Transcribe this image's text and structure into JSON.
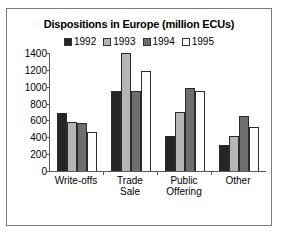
{
  "chart_data": {
    "type": "bar",
    "title": "Dispositions in Europe (million ECUs)",
    "xlabel": "",
    "ylabel": "",
    "ylim": [
      0,
      1400
    ],
    "yticks": [
      0,
      200,
      400,
      600,
      800,
      1000,
      1200,
      1400
    ],
    "grid": false,
    "legend_position": "top-center",
    "categories": [
      "Write-offs",
      "Trade Sale",
      "Public Offering",
      "Other"
    ],
    "series": [
      {
        "name": "1992",
        "color": "#262626",
        "values": [
          690,
          950,
          410,
          305
        ]
      },
      {
        "name": "1993",
        "color": "#b5b5b5",
        "values": [
          580,
          1400,
          700,
          410
        ]
      },
      {
        "name": "1994",
        "color": "#6e6e6e",
        "values": [
          575,
          950,
          990,
          650
        ]
      },
      {
        "name": "1995",
        "color": "#fdfdfd",
        "values": [
          460,
          1190,
          950,
          525
        ]
      }
    ]
  },
  "legend": {
    "items": [
      {
        "label": "1992"
      },
      {
        "label": "1993"
      },
      {
        "label": "1994"
      },
      {
        "label": "1995"
      }
    ]
  },
  "axes": {
    "y_tick_labels": [
      "1400",
      "1200",
      "1000",
      "800",
      "600",
      "400",
      "200",
      "0"
    ],
    "x_tick_labels": [
      {
        "line1": "Write-offs",
        "line2": ""
      },
      {
        "line1": "Trade",
        "line2": "Sale"
      },
      {
        "line1": "Public",
        "line2": "Offering"
      },
      {
        "line1": "Other",
        "line2": ""
      }
    ]
  }
}
